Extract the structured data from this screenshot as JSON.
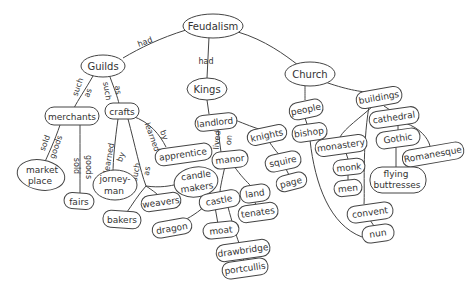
{
  "diagram": {
    "type": "concept-map",
    "root": "Feudalism",
    "nodes": {
      "feudalism": "Feudalism",
      "guilds": "Guilds",
      "kings": "Kings",
      "church": "Church",
      "merchants": "merchants",
      "crafts": "crafts",
      "landlord": "landlord",
      "knights": "knights",
      "people": "people",
      "buildings": "buildings",
      "bishop": "bishop",
      "cathedral": "cathedral",
      "monastery": "monastery",
      "gothic": "Gothic",
      "romanesque": "Romanesque",
      "monk": "monk",
      "men": "men",
      "flying_buttresses_1": "flying",
      "flying_buttresses_2": "buttresses",
      "convent": "convent",
      "nun": "nun",
      "apprentice": "apprentice",
      "manor": "manor",
      "squire": "squire",
      "page": "page",
      "market_place_1": "market",
      "market_place_2": "place",
      "fairs": "fairs",
      "journeyman_1": "jorney-",
      "journeyman_2": "man",
      "candle_makers_1": "candle",
      "candle_makers_2": "makers",
      "castle": "castle",
      "land": "land",
      "tenates": "tenates",
      "weavers": "weavers",
      "bakers": "bakers",
      "dragon": "dragon",
      "moat": "moat",
      "drawbridge": "drawbridge",
      "portcullis": "portcullis"
    },
    "links": {
      "feudalism_guilds": "had",
      "feudalism_kings": "had",
      "guilds_merchants_1": "such",
      "guilds_merchants_2": "as",
      "guilds_crafts_1": "such",
      "guilds_crafts_2": "as",
      "merchants_market_1": "sold",
      "merchants_market_2": "goods",
      "merchants_fairs_1": "sold",
      "merchants_fairs_2": "goods",
      "crafts_journeyman_1": "learned",
      "crafts_journeyman_2": "by",
      "crafts_apprentice_1": "learned",
      "crafts_apprentice_2": "by",
      "crafts_such_as_1": "such",
      "crafts_such_as_2": "as",
      "landlord_manor_1": "lived",
      "landlord_manor_2": "on"
    }
  }
}
